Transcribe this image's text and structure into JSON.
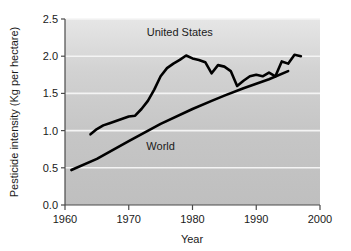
{
  "chart_data": {
    "type": "line",
    "title": "",
    "subtitle": "",
    "xlabel": "Year",
    "ylabel": "Pesticide intensity (Kg per hectare)",
    "xlim": [
      1960,
      2000
    ],
    "ylim": [
      0.0,
      2.5
    ],
    "xticks": [
      "1960",
      "1970",
      "1980",
      "1990",
      "2000"
    ],
    "xtick_values": [
      1960,
      1970,
      1980,
      1990,
      2000
    ],
    "yticks": [
      "0.0",
      "0.5",
      "1.0",
      "1.5",
      "2.0",
      "2.5"
    ],
    "ytick_values": [
      0.0,
      0.5,
      1.0,
      1.5,
      2.0,
      2.5
    ],
    "grid": "horizontal-white-gridlines",
    "legend_position": "inline-annotations",
    "plot_background": "#c9c9c9",
    "line_color": "#000000",
    "series": [
      {
        "name": "United States",
        "label_x": 1978.0,
        "label_y": 2.27,
        "x": [
          1964,
          1965,
          1966,
          1967,
          1968,
          1969,
          1970,
          1971,
          1972,
          1973,
          1974,
          1975,
          1976,
          1977,
          1978,
          1979,
          1980,
          1981,
          1982,
          1983,
          1984,
          1985,
          1986,
          1987,
          1988,
          1989,
          1990,
          1991,
          1992,
          1993,
          1994,
          1995,
          1996,
          1997
        ],
        "values": [
          0.95,
          1.02,
          1.07,
          1.1,
          1.13,
          1.16,
          1.19,
          1.2,
          1.29,
          1.4,
          1.55,
          1.73,
          1.84,
          1.9,
          1.95,
          2.01,
          1.97,
          1.95,
          1.92,
          1.77,
          1.88,
          1.86,
          1.8,
          1.6,
          1.67,
          1.73,
          1.75,
          1.73,
          1.78,
          1.73,
          1.93,
          1.9,
          2.02,
          2.0
        ]
      },
      {
        "name": "World",
        "label_x": 1975.0,
        "label_y": 0.74,
        "x": [
          1961,
          1965,
          1970,
          1975,
          1980,
          1983,
          1985,
          1988,
          1990,
          1992,
          1995
        ],
        "values": [
          0.47,
          0.62,
          0.86,
          1.09,
          1.29,
          1.4,
          1.47,
          1.57,
          1.63,
          1.69,
          1.8
        ]
      }
    ]
  },
  "axes": {
    "y_axis_title": "Pesticide intensity (Kg per hectare)",
    "x_axis_title": "Year"
  }
}
